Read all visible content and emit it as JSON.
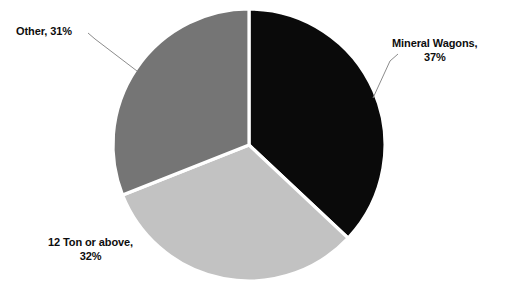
{
  "chart_data": {
    "type": "pie",
    "title": "",
    "subtitle": "",
    "xlabel": "",
    "ylabel": "",
    "legend_position": "none",
    "grid": false,
    "start_angle_deg": 0,
    "direction": "clockwise",
    "categories": [
      "Mineral Wagons",
      "12 Ton or above",
      "Other"
    ],
    "values": [
      37,
      32,
      31
    ],
    "value_unit": "%",
    "slices": [
      {
        "name": "Mineral Wagons",
        "value": 37,
        "label_line1": "Mineral Wagons,",
        "label_line2": "37%",
        "color": "#0a0a0a",
        "start_deg": 0,
        "end_deg": 133.2,
        "has_leader_line": true
      },
      {
        "name": "12 Ton or above",
        "value": 32,
        "label_line1": "12 Ton or above,",
        "label_line2": "32%",
        "color": "#c2c2c2",
        "start_deg": 133.2,
        "end_deg": 248.4,
        "has_leader_line": false
      },
      {
        "name": "Other",
        "value": 31,
        "label_line1": "Other, 31%",
        "label_line2": "",
        "color": "#757575",
        "start_deg": 248.4,
        "end_deg": 360,
        "has_leader_line": true
      }
    ],
    "separator_color": "#ffffff",
    "leader_line_color": "#8c8c8c",
    "background_color": "#ffffff"
  }
}
